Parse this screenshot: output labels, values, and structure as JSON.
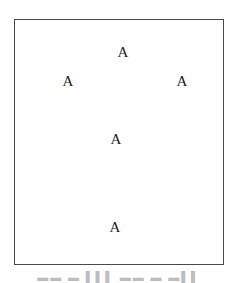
{
  "diagram": {
    "frame": {
      "border_color": "#4a4a4a"
    },
    "nodes": [
      {
        "label": "A",
        "x": 123,
        "y": 52
      },
      {
        "label": "A",
        "x": 68,
        "y": 81
      },
      {
        "label": "A",
        "x": 182,
        "y": 81
      },
      {
        "label": "A",
        "x": 116,
        "y": 139
      },
      {
        "label": "A",
        "x": 115,
        "y": 227
      }
    ],
    "caption": "▬▬ ▬ ▌▌▌ ▬▬ ▬ ▬▌▌"
  }
}
